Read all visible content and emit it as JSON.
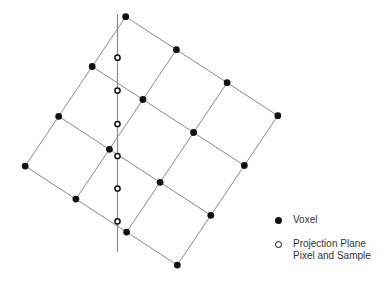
{
  "diagram": {
    "grid": {
      "origin": [
        125.7,
        16.7
      ],
      "step_i": [
        50.7,
        33.0
      ],
      "step_j": [
        -33.5,
        49.8
      ],
      "size": 4
    },
    "projection_line": {
      "x": 117.5,
      "y1": 14,
      "y2": 252
    },
    "samples_y": [
      57.7,
      90.5,
      124,
      156,
      188.5,
      221.3
    ],
    "colors": {
      "grid_line": "#8a8a8a",
      "voxel": "#111111",
      "sample_stroke": "#111111",
      "projection_line": "#8a8a8a"
    }
  },
  "legend": {
    "voxel_label": "Voxel",
    "sample_label_line1": "Projection Plane",
    "sample_label_line2": "Pixel and Sample"
  }
}
